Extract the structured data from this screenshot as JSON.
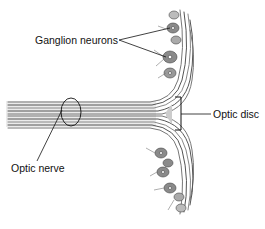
{
  "diagram": {
    "labels": {
      "ganglion": "Ganglion neurons",
      "disc": "Optic disc",
      "nerve": "Optic nerve"
    },
    "colors": {
      "fiber": "#5a5a5a",
      "fiber_light": "#9a9a9a",
      "cell": "#6e6e6e",
      "line": "#111111"
    }
  }
}
